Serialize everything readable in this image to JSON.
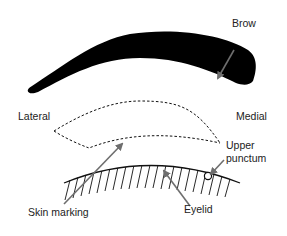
{
  "labels": {
    "brow": "Brow",
    "lateral": "Lateral",
    "medial": "Medial",
    "upper_punctum_line1": "Upper",
    "upper_punctum_line2": "punctum",
    "skin_marking": "Skin marking",
    "eyelid": "Eyelid"
  },
  "colors": {
    "brow_fill": "#000000",
    "arrow": "#6e6e6e",
    "line": "#111111"
  }
}
